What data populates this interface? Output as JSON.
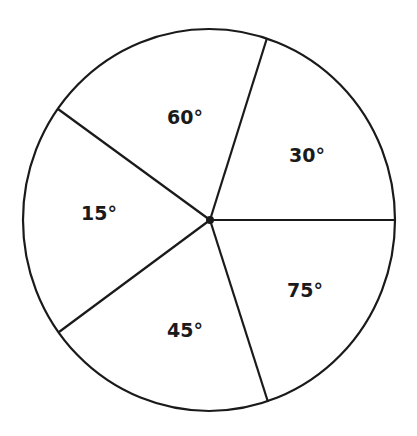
{
  "diagram": {
    "caption_fragment": "",
    "stroke_color": "#1a1a1a",
    "background": "#ffffff",
    "circle": {
      "cx": 209,
      "cy": 220,
      "rx": 186,
      "ry": 191
    },
    "center_dot": {
      "cx": 210,
      "cy": 220,
      "r": 4
    },
    "radii": [
      {
        "name": "radius-right",
        "x": 395,
        "y": 220
      },
      {
        "name": "radius-upper-right",
        "x": 267,
        "y": 38
      },
      {
        "name": "radius-upper-left",
        "x": 58,
        "y": 109
      },
      {
        "name": "radius-lower-left",
        "x": 59,
        "y": 332
      },
      {
        "name": "radius-lower-right",
        "x": 268,
        "y": 402
      }
    ],
    "sectors": [
      {
        "name": "sector-60",
        "label": "60°",
        "x": 185,
        "y": 124
      },
      {
        "name": "sector-30",
        "label": "30°",
        "x": 307,
        "y": 162
      },
      {
        "name": "sector-15",
        "label": "15°",
        "x": 99,
        "y": 220
      },
      {
        "name": "sector-75",
        "label": "75°",
        "x": 305,
        "y": 297
      },
      {
        "name": "sector-45",
        "label": "45°",
        "x": 185,
        "y": 337
      }
    ]
  }
}
